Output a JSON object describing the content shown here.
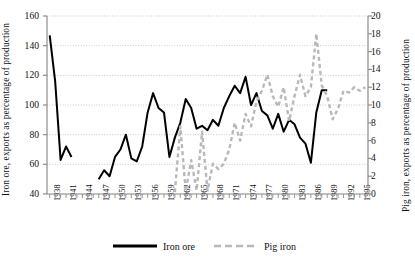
{
  "chart_data": {
    "type": "line",
    "title": "",
    "xlabel": "",
    "ylabel": "Iron ore, exports as percentage of production",
    "ylabel_right": "Pig iron, exports as percentage of production",
    "grid": true,
    "legend_position": "bottom",
    "xlim": [
      1937.5,
      1996.5
    ],
    "ylim": [
      40,
      160
    ],
    "ylim_right": [
      0,
      20
    ],
    "y_ticks": [
      40,
      60,
      80,
      100,
      120,
      140,
      160
    ],
    "y_ticks_right": [
      0,
      2,
      4,
      6,
      8,
      10,
      12,
      14,
      16,
      18,
      20
    ],
    "x_tick_labels": [
      "1938",
      "1941",
      "1944",
      "1947",
      "1950",
      "1953",
      "1956",
      "1959",
      "1962",
      "1965",
      "1968",
      "1971",
      "1974",
      "1977",
      "1980",
      "1983",
      "1986",
      "1989",
      "1992",
      "1995"
    ],
    "x_tick_values": [
      1938,
      1941,
      1944,
      1947,
      1950,
      1953,
      1956,
      1959,
      1962,
      1965,
      1968,
      1971,
      1974,
      1977,
      1980,
      1983,
      1986,
      1989,
      1992,
      1995
    ],
    "series": [
      {
        "name": "Iron ore",
        "axis": "left",
        "style": "solid",
        "color": "#000000",
        "x": [
          1938,
          1939,
          1940,
          1941,
          1942,
          1947,
          1948,
          1949,
          1950,
          1951,
          1952,
          1953,
          1954,
          1955,
          1956,
          1957,
          1958,
          1959,
          1960,
          1961,
          1962,
          1963,
          1964,
          1965,
          1966,
          1967,
          1968,
          1969,
          1970,
          1971,
          1972,
          1973,
          1974,
          1975,
          1976,
          1977,
          1978,
          1979,
          1980,
          1981,
          1982,
          1983,
          1984,
          1985,
          1986,
          1987,
          1988,
          1989
        ],
        "values": [
          147,
          116,
          63,
          72,
          65,
          50,
          56,
          52,
          65,
          70,
          80,
          64,
          62,
          72,
          95,
          108,
          98,
          95,
          65,
          78,
          88,
          104,
          98,
          84,
          86,
          83,
          90,
          86,
          98,
          106,
          113,
          108,
          119,
          100,
          108,
          96,
          93,
          84,
          94,
          82,
          90,
          87,
          78,
          74,
          61,
          95,
          110,
          110
        ]
      },
      {
        "name": "Pig iron",
        "axis": "right",
        "style": "dashed",
        "color": "#b8b8b8",
        "x": [
          1961,
          1962,
          1963,
          1964,
          1965,
          1966,
          1967,
          1968,
          1969,
          1970,
          1971,
          1972,
          1973,
          1974,
          1975,
          1976,
          1977,
          1978,
          1979,
          1980,
          1981,
          1982,
          1983,
          1984,
          1985,
          1986,
          1987,
          1988,
          1989,
          1990,
          1991,
          1992,
          1993,
          1994,
          1995,
          1996
        ],
        "values": [
          0.2,
          7.6,
          0.3,
          3.8,
          0.4,
          7.0,
          0.4,
          3.4,
          2.8,
          3.4,
          5.0,
          8.0,
          6.0,
          9.0,
          7.6,
          10.4,
          11.6,
          13.4,
          11.0,
          9.8,
          12.0,
          8.2,
          11.0,
          13.4,
          11.0,
          12.0,
          18.0,
          12.2,
          11.0,
          8.4,
          9.6,
          11.6,
          11.4,
          12.0,
          11.6,
          12.0
        ]
      }
    ]
  },
  "legend": {
    "items": [
      {
        "label": "Iron ore",
        "style": "solid",
        "color": "#000000"
      },
      {
        "label": "Pig iron",
        "style": "dashed",
        "color": "#b8b8b8"
      }
    ]
  }
}
